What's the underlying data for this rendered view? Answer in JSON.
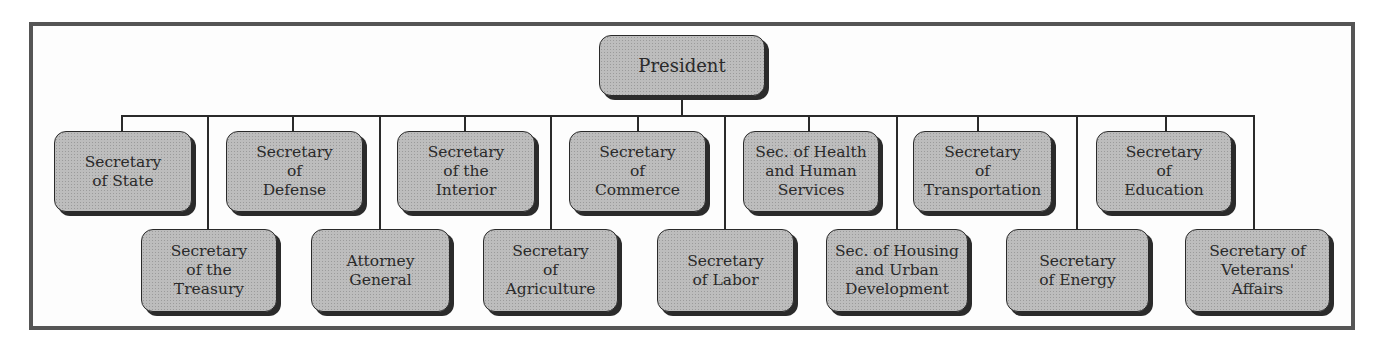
{
  "chart": {
    "title": "",
    "root": {
      "label": "President"
    },
    "top_row": [
      {
        "label": "Secretary\nof State"
      },
      {
        "label": "Secretary\nof\nDefense"
      },
      {
        "label": "Secretary\nof the\nInterior"
      },
      {
        "label": "Secretary\nof\nCommerce"
      },
      {
        "label": "Sec. of Health\nand Human\nServices"
      },
      {
        "label": "Secretary\nof\nTransportation"
      },
      {
        "label": "Secretary\nof\nEducation"
      }
    ],
    "bottom_row": [
      {
        "label": "Secretary\nof the\nTreasury"
      },
      {
        "label": "Attorney\nGeneral"
      },
      {
        "label": "Secretary\nof\nAgriculture"
      },
      {
        "label": "Secretary\nof Labor"
      },
      {
        "label": "Sec. of Housing\nand Urban\nDevelopment"
      },
      {
        "label": "Secretary\nof Energy"
      },
      {
        "label": "Secretary of\nVeterans'\nAffairs"
      }
    ]
  },
  "colors": {
    "frame": "#555555",
    "box_fill": "#bdbdbd",
    "box_border": "#2a2a2a",
    "shadow": "#2b2b2b",
    "line": "#2a2a2a"
  }
}
